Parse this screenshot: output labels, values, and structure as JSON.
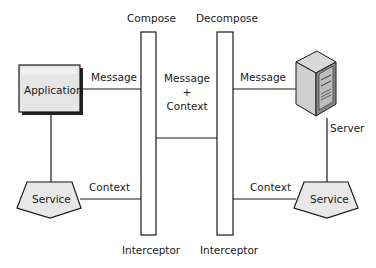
{
  "diagram": {
    "nodes": {
      "application": {
        "label": "Application"
      },
      "service_left": {
        "label": "Service"
      },
      "server": {
        "label": "Server"
      },
      "service_right": {
        "label": "Service"
      },
      "compose_interceptor": {
        "title": "Compose",
        "caption": "Interceptor"
      },
      "decompose_interceptor": {
        "title": "Decompose",
        "caption": "Interceptor"
      }
    },
    "edges": {
      "app_to_compose": {
        "label": "Message"
      },
      "service_to_compose": {
        "label": "Context"
      },
      "compose_to_decompose": {
        "label_line1": "Message",
        "label_line2": "+",
        "label_line3": "Context"
      },
      "decompose_to_server": {
        "label": "Message"
      },
      "decompose_to_service": {
        "label": "Context"
      }
    },
    "colors": {
      "stroke": "#1a1a1a",
      "shape_fill": "#e8e8e8",
      "shadow": "#222222"
    }
  }
}
